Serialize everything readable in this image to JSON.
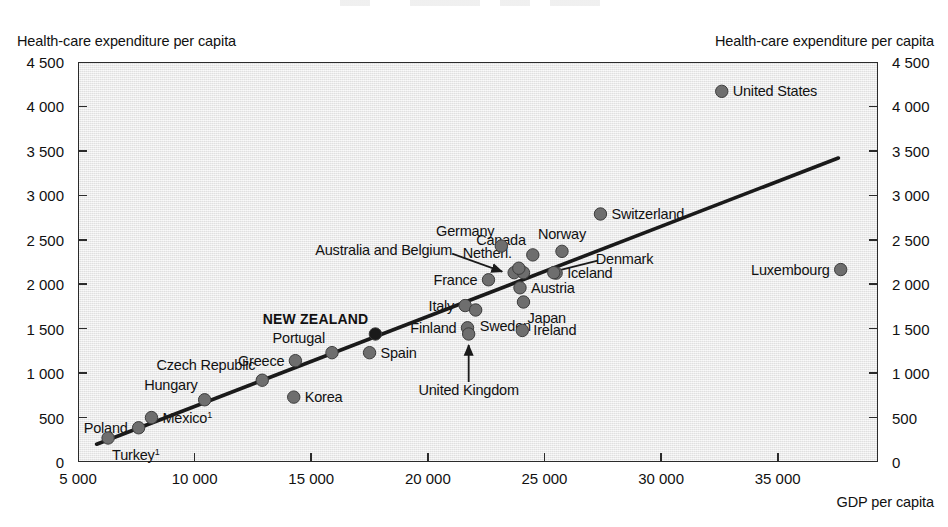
{
  "chart_data": {
    "type": "scatter",
    "title": "",
    "xlabel": "GDP per capita",
    "ylabel": "Health-care expenditure per capita",
    "ylabel_right": "Health-care expenditure per capita",
    "xlim": [
      5000,
      39300
    ],
    "ylim": [
      0,
      4500
    ],
    "xticks": [
      5000,
      10000,
      15000,
      20000,
      25000,
      30000,
      35000
    ],
    "xticklabels": [
      "5 000",
      "10 000",
      "15 000",
      "20 000",
      "25 000",
      "30 000",
      "35 000"
    ],
    "yticks": [
      0,
      500,
      1000,
      1500,
      2000,
      2500,
      3000,
      3500,
      4000,
      4500
    ],
    "yticklabels": [
      "0",
      "500",
      "1 000",
      "1 500",
      "2 000",
      "2 500",
      "3 000",
      "3 500",
      "4 000",
      "4 500"
    ],
    "grid": false,
    "legend": null,
    "plot_bg_color": "#e9e9e9",
    "point_color": "#6e6e6e",
    "highlight_color": "#1a1a1a",
    "trendline_color": "#1a1a1a",
    "trendline": {
      "x0": 5800,
      "y0": 200,
      "x1": 37600,
      "y1": 3420
    },
    "points": [
      {
        "name": "Turkey",
        "label": "Turkey",
        "footnote": "1",
        "x": 6290,
        "y": 270,
        "label_pos": "below"
      },
      {
        "name": "Poland",
        "label": "Poland",
        "x": 7600,
        "y": 385,
        "label_pos": "left"
      },
      {
        "name": "Mexico",
        "label": "Mexico",
        "footnote": "1",
        "x": 8150,
        "y": 500,
        "label_pos": "right"
      },
      {
        "name": "Hungary",
        "label": "Hungary",
        "x": 10430,
        "y": 700,
        "label_pos": "above-left"
      },
      {
        "name": "Czech Republic",
        "label": "Czech Republic",
        "x": 12900,
        "y": 920,
        "label_pos": "above-left"
      },
      {
        "name": "Korea",
        "label": "Korea",
        "x": 14250,
        "y": 730,
        "label_pos": "right"
      },
      {
        "name": "Greece",
        "label": "Greece",
        "x": 14320,
        "y": 1140,
        "label_pos": "left"
      },
      {
        "name": "Portugal",
        "label": "Portugal",
        "x": 15890,
        "y": 1230,
        "label_pos": "above-left"
      },
      {
        "name": "Spain",
        "label": "Spain",
        "x": 17500,
        "y": 1230,
        "label_pos": "right"
      },
      {
        "name": "New Zealand",
        "label": "NEW ZEALAND",
        "x": 17750,
        "y": 1440,
        "label_pos": "above-left",
        "highlight": true
      },
      {
        "name": "Finland",
        "label": "Finland",
        "x": 21700,
        "y": 1510,
        "label_pos": "left"
      },
      {
        "name": "United Kingdom",
        "label": "United Kingdom",
        "x": 21750,
        "y": 1440,
        "label_pos": "arrow-below"
      },
      {
        "name": "Italy",
        "label": "Italy",
        "x": 21600,
        "y": 1760,
        "label_pos": "left"
      },
      {
        "name": "Sweden",
        "label": "Sweden",
        "x": 22050,
        "y": 1710,
        "label_pos": "below-right"
      },
      {
        "name": "France",
        "label": "France",
        "x": 22600,
        "y": 2050,
        "label_pos": "left"
      },
      {
        "name": "Germany",
        "label": "Germany",
        "x": 23150,
        "y": 2430,
        "label_pos": "above-left"
      },
      {
        "name": "Australia",
        "label": "Australia and Belgium",
        "x": 23700,
        "y": 2130,
        "label_pos": "arrow-left"
      },
      {
        "name": "Belgium",
        "label": "",
        "x": 24100,
        "y": 2130,
        "label_pos": "none"
      },
      {
        "name": "Netherlands",
        "label": "Netherl.",
        "x": 23900,
        "y": 2180,
        "label_pos": "above-left"
      },
      {
        "name": "Austria",
        "label": "Austria",
        "x": 23950,
        "y": 1960,
        "label_pos": "right"
      },
      {
        "name": "Japan",
        "label": "Japan",
        "x": 24100,
        "y": 1800,
        "label_pos": "below-right"
      },
      {
        "name": "Canada",
        "label": "Canada",
        "x": 24500,
        "y": 2330,
        "label_pos": "above-left"
      },
      {
        "name": "Ireland",
        "label": "Ireland",
        "x": 24050,
        "y": 1480,
        "label_pos": "right"
      },
      {
        "name": "Iceland",
        "label": "Iceland",
        "x": 25500,
        "y": 2125,
        "label_pos": "right"
      },
      {
        "name": "Denmark",
        "label": "Denmark",
        "x": 25400,
        "y": 2130,
        "label_pos": "line-right"
      },
      {
        "name": "Norway",
        "label": "Norway",
        "x": 25750,
        "y": 2370,
        "label_pos": "above"
      },
      {
        "name": "Switzerland",
        "label": "Switzerland",
        "x": 27400,
        "y": 2790,
        "label_pos": "right"
      },
      {
        "name": "United States",
        "label": "United States",
        "x": 32600,
        "y": 4170,
        "label_pos": "right"
      },
      {
        "name": "Luxembourg",
        "label": "Luxembourg",
        "x": 37700,
        "y": 2165,
        "label_pos": "left"
      }
    ]
  }
}
